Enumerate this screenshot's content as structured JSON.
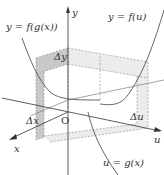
{
  "diagram": {
    "labels": {
      "composite": "y = f(g(x))",
      "outer": "y = f(u)",
      "inner": "u = g(x)",
      "delta_y": "Δy",
      "delta_x": "Δx",
      "delta_u": "Δu",
      "origin": "O",
      "axis_x": "x",
      "axis_y": "y",
      "axis_u": "u"
    },
    "colors": {
      "axis": "#333333",
      "curve": "#555555",
      "shade_dark": "#c8c8c8",
      "shade_light": "#ececec",
      "dash": "#888888"
    }
  }
}
